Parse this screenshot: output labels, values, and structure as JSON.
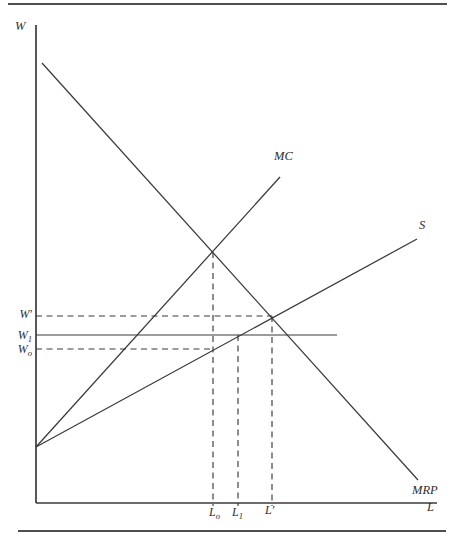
{
  "figure": {
    "type": "labor-market-monopsony-diagram",
    "axis": {
      "y_label": "W",
      "x_label": "L"
    },
    "curve_labels": {
      "mc": "MC",
      "s": "S",
      "mrp": "MRP"
    },
    "wage_labels": {
      "w_prime": "W′",
      "w1": {
        "base": "W",
        "sub": "1"
      },
      "wo": {
        "base": "W",
        "sub": "o"
      }
    },
    "labor_labels": {
      "lo": {
        "base": "L",
        "sub": "o"
      },
      "l1": {
        "base": "L",
        "sub": "1"
      },
      "l_prime": "L′"
    },
    "colors": {
      "line": "#3a3a3a",
      "rule": "#4f4f4f",
      "background": "#ffffff"
    }
  }
}
